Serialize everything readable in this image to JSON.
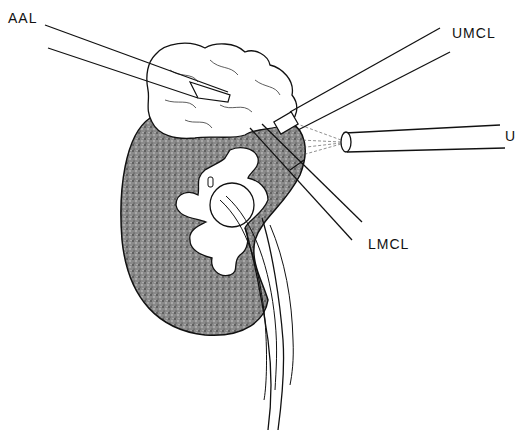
{
  "figure": {
    "type": "surgical-illustration",
    "ink_color": "#111111",
    "background_color": "#ffffff",
    "stipple_color": "#555555"
  },
  "labels": {
    "aal": "AAL",
    "umcl": "UMCL",
    "u": "U",
    "lmcl": "LMCL"
  },
  "instruments": [
    {
      "id": "aal",
      "label_key": "AAL",
      "from": [
        45,
        25
      ],
      "to": [
        230,
        95
      ]
    },
    {
      "id": "umcl",
      "label_key": "UMCL",
      "from": [
        440,
        30
      ],
      "to": [
        285,
        125
      ]
    },
    {
      "id": "u",
      "label_key": "U",
      "from": [
        500,
        125
      ],
      "to": [
        345,
        142
      ]
    },
    {
      "id": "lmcl",
      "label_key": "LMCL",
      "from": [
        350,
        240
      ],
      "to": [
        258,
        128
      ]
    }
  ]
}
